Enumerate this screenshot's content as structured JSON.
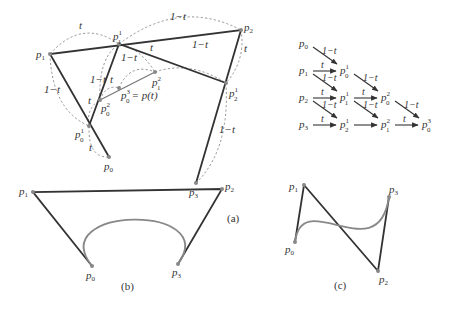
{
  "figure": {
    "panel_a": {
      "caption": "(a)",
      "points": {
        "p0": "p0",
        "p1": "p1",
        "p2": "p2",
        "p3": "p3",
        "p01": "p0^1",
        "p11": "p1^1",
        "p21": "p2^1",
        "p02": "p0^2",
        "p12": "p1^2",
        "p03": "p0^3 = p(t)"
      },
      "weights": {
        "t": "t",
        "one_minus_t": "1−t"
      }
    },
    "triangle_scheme": {
      "rows": [
        [
          "p0"
        ],
        [
          "p1",
          "p0^1"
        ],
        [
          "p2",
          "p1^1",
          "p0^2"
        ],
        [
          "p3",
          "p2^1",
          "p1^2",
          "p0^3"
        ]
      ],
      "horizontal_arrow_label": "t",
      "diagonal_arrow_label": "1−t"
    },
    "panel_b": {
      "caption": "(b)",
      "points": [
        "p0",
        "p1",
        "p2",
        "p3"
      ]
    },
    "panel_c": {
      "caption": "(c)",
      "points": [
        "p0",
        "p1",
        "p2",
        "p3"
      ]
    },
    "colors": {
      "control_polygon": "#333333",
      "curve": "#888888",
      "construction": "#888888"
    }
  },
  "labels": {
    "p": "p",
    "sub0": "0",
    "sub1": "1",
    "sub2": "2",
    "sub3": "3",
    "eq_pt": "= p(t)",
    "t": "t",
    "omt": "1−t",
    "cap_a": "(a)",
    "cap_b": "(b)",
    "cap_c": "(c)"
  }
}
